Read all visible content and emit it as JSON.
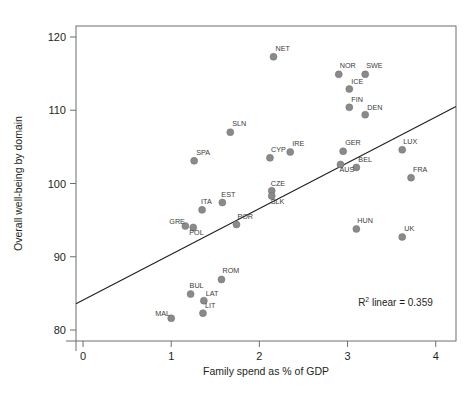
{
  "chart_data": {
    "type": "scatter",
    "title": "",
    "xlabel": "Family spend as % of GDP",
    "ylabel": "Overall well-being by domain",
    "xlim": [
      -0.08,
      4.23
    ],
    "ylim": [
      78.5,
      121.5
    ],
    "xticks": [
      0,
      1,
      2,
      3,
      4
    ],
    "xtick_labels": [
      "0",
      "1",
      "2",
      "3",
      "4"
    ],
    "yticks": [
      80,
      90,
      100,
      110,
      120
    ],
    "ytick_labels": [
      "80",
      "90",
      "100",
      "110",
      "120"
    ],
    "grid": false,
    "legend": "none",
    "annotations": [
      {
        "name": "r2-annotation",
        "text": "R2 linear = 0.359",
        "text_prefix": "R",
        "text_sup": "2",
        "text_suffix": " linear = 0.359",
        "x": 3.12,
        "y": 83.3
      }
    ],
    "fit_line": {
      "name": "linear-fit",
      "r_squared": 0.359,
      "x_start": -0.08,
      "y_start": 83.6,
      "x_end": 4.23,
      "y_end": 110.5
    },
    "marker_color": "#8a8a8a",
    "points": [
      {
        "label": "NET",
        "x": 2.16,
        "y": 117.3,
        "label_dx": 2,
        "label_dy": -6
      },
      {
        "label": "NOR",
        "x": 2.9,
        "y": 114.9,
        "label_dx": 1,
        "label_dy": -6
      },
      {
        "label": "SWE",
        "x": 3.2,
        "y": 114.9,
        "label_dx": 1,
        "label_dy": -6
      },
      {
        "label": "ICE",
        "x": 3.02,
        "y": 112.9,
        "label_dx": 2,
        "label_dy": -5
      },
      {
        "label": "FIN",
        "x": 3.02,
        "y": 110.4,
        "label_dx": 2,
        "label_dy": -5
      },
      {
        "label": "DEN",
        "x": 3.2,
        "y": 109.4,
        "label_dx": 2,
        "label_dy": -5
      },
      {
        "label": "SLN",
        "x": 1.67,
        "y": 107.0,
        "label_dx": 2,
        "label_dy": -6
      },
      {
        "label": "IRE",
        "x": 2.35,
        "y": 104.3,
        "label_dx": 2,
        "label_dy": -6
      },
      {
        "label": "CYP",
        "x": 2.12,
        "y": 103.5,
        "label_dx": 1,
        "label_dy": -6
      },
      {
        "label": "GER",
        "x": 2.95,
        "y": 104.4,
        "label_dx": 2,
        "label_dy": -6
      },
      {
        "label": "LUX",
        "x": 3.62,
        "y": 104.6,
        "label_dx": 1,
        "label_dy": -6
      },
      {
        "label": "SPA",
        "x": 1.26,
        "y": 103.1,
        "label_dx": 2,
        "label_dy": -6
      },
      {
        "label": "BEL",
        "x": 3.1,
        "y": 102.2,
        "label_dx": 2,
        "label_dy": -5
      },
      {
        "label": "AUS",
        "x": 2.92,
        "y": 102.6,
        "label_dx": -1,
        "label_dy": 8
      },
      {
        "label": "FRA",
        "x": 3.72,
        "y": 100.8,
        "label_dx": 2,
        "label_dy": -6
      },
      {
        "label": "CZE",
        "x": 2.14,
        "y": 99.0,
        "label_dx": -1,
        "label_dy": -5
      },
      {
        "label": "SLK",
        "x": 2.14,
        "y": 98.3,
        "label_dx": -1,
        "label_dy": 8
      },
      {
        "label": "EST",
        "x": 1.58,
        "y": 97.4,
        "label_dx": -1,
        "label_dy": -6
      },
      {
        "label": "ITA",
        "x": 1.35,
        "y": 96.4,
        "label_dx": -1,
        "label_dy": -6
      },
      {
        "label": "POR",
        "x": 1.74,
        "y": 94.4,
        "label_dx": 1,
        "label_dy": -6
      },
      {
        "label": "POL",
        "x": 1.25,
        "y": 94.0,
        "label_dx": -4,
        "label_dy": 8
      },
      {
        "label": "GRE",
        "x": 1.16,
        "y": 94.2,
        "label_dx": -16,
        "label_dy": -2
      },
      {
        "label": "HUN",
        "x": 3.1,
        "y": 93.8,
        "label_dx": 1,
        "label_dy": -6
      },
      {
        "label": "UK",
        "x": 3.62,
        "y": 92.7,
        "label_dx": 2,
        "label_dy": -6
      },
      {
        "label": "ROM",
        "x": 1.57,
        "y": 86.9,
        "label_dx": 1,
        "label_dy": -6
      },
      {
        "label": "BUL",
        "x": 1.22,
        "y": 84.9,
        "label_dx": -1,
        "label_dy": -6
      },
      {
        "label": "LAT",
        "x": 1.37,
        "y": 84.0,
        "label_dx": 2,
        "label_dy": -5
      },
      {
        "label": "LIT",
        "x": 1.36,
        "y": 82.3,
        "label_dx": 2,
        "label_dy": -5
      },
      {
        "label": "MAL",
        "x": 1.0,
        "y": 81.6,
        "label_dx": -16,
        "label_dy": -2
      }
    ]
  }
}
